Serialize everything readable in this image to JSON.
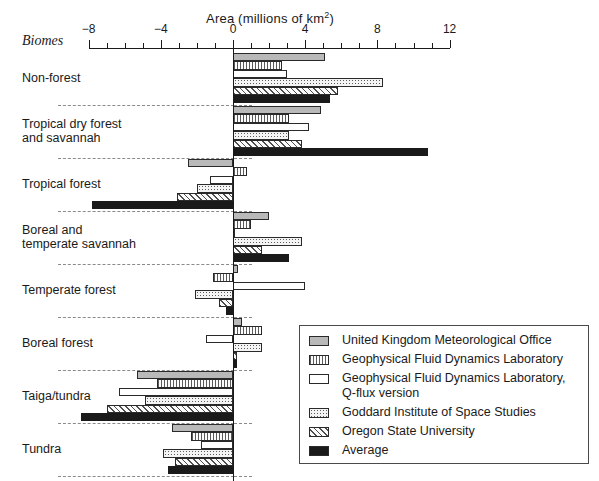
{
  "chart_data": {
    "type": "bar",
    "orientation": "horizontal",
    "title": "",
    "xlabel": "Area (millions of km2)",
    "xlabel_display": "Area (millions of km",
    "xlabel_sup": "2",
    "xlabel_tail": ")",
    "ylabel": "Biomes",
    "xlim": [
      -8,
      12
    ],
    "xticks": [
      -8,
      -7,
      -6,
      -5,
      -4,
      -3,
      -2,
      -1,
      0,
      1,
      2,
      3,
      4,
      5,
      6,
      7,
      8,
      9,
      10,
      11,
      12
    ],
    "xticklabels_major": [
      "-8",
      "-4",
      "0",
      "4",
      "8",
      "12"
    ],
    "xticklabel_values": [
      -8,
      -4,
      0,
      4,
      8,
      12
    ],
    "grid": false,
    "legend_position": "lower-right",
    "categories": [
      "Non-forest",
      "Tropical dry forest\nand savannah",
      "Tropical forest",
      "Boreal and\ntemperate savannah",
      "Temperate forest",
      "Boreal forest",
      "Taiga/tundra",
      "Tundra"
    ],
    "series": [
      {
        "name": "United Kingdom Meteorological Office",
        "pattern": "solid-gray",
        "color": "#b9b9b9",
        "values": [
          5.1,
          4.9,
          -2.5,
          2.0,
          0.3,
          0.5,
          -5.3,
          -3.4
        ]
      },
      {
        "name": "Geophysical Fluid Dynamics Laboratory",
        "pattern": "vertical-stripes",
        "color": "#fdfdfd",
        "values": [
          2.7,
          3.1,
          0.8,
          1.0,
          -1.1,
          1.6,
          -4.2,
          -2.3
        ]
      },
      {
        "name": "Geophysical Fluid Dynamics Laboratory,\n   Q-flux version",
        "pattern": "white",
        "color": "#ffffff",
        "values": [
          3.0,
          4.2,
          -1.3,
          0.1,
          4.0,
          -1.5,
          -6.3,
          -1.8
        ]
      },
      {
        "name": "Goddard Institute of Space Studies",
        "pattern": "dots",
        "color": "#f4f4f4",
        "values": [
          8.3,
          3.1,
          -2.0,
          3.8,
          -2.1,
          1.6,
          -4.9,
          -3.9
        ]
      },
      {
        "name": "Oregon State University",
        "pattern": "diagonal-hatch",
        "color": "#fbfbfb",
        "values": [
          5.8,
          3.8,
          -3.1,
          1.6,
          -0.8,
          0.2,
          -7.0,
          -3.2
        ]
      },
      {
        "name": "Average",
        "pattern": "solid-black",
        "color": "#1a1a1a",
        "values": [
          5.4,
          10.8,
          -7.8,
          3.1,
          -0.4,
          0.2,
          -8.4,
          -3.6
        ]
      }
    ]
  },
  "legend": {
    "items": [
      {
        "label": "United Kingdom Meteorological Office",
        "pattern": "solid-gray"
      },
      {
        "label": "Geophysical Fluid Dynamics Laboratory",
        "pattern": "vertical-stripes"
      },
      {
        "label": "Geophysical Fluid Dynamics Laboratory,\n   Q-flux version",
        "pattern": "white"
      },
      {
        "label": "Goddard Institute of Space Studies",
        "pattern": "dots"
      },
      {
        "label": "Oregon State University",
        "pattern": "diagonal-hatch"
      },
      {
        "label": "Average",
        "pattern": "solid-black"
      }
    ]
  }
}
